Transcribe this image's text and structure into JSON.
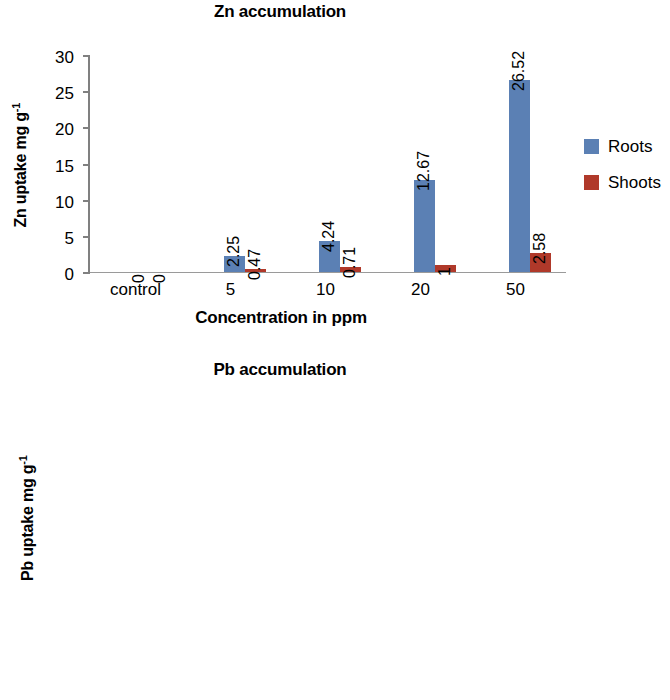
{
  "charts": [
    {
      "id": "zn",
      "title": "Zn accumulation",
      "ylabel_main": "Zn uptake mg g",
      "ylabel_sup": "-1",
      "xlabel": "Concentration in ppm",
      "legend": [
        {
          "label": "Roots",
          "color": "#5b80b4"
        },
        {
          "label": "Shoots",
          "color": "#b0392a"
        }
      ],
      "yticks": [
        "0",
        "5",
        "10",
        "15",
        "20",
        "25",
        "30"
      ],
      "categories": [
        "control",
        "5",
        "10",
        "20",
        "50"
      ],
      "roots_labels": [
        "0",
        "2.25",
        "4.24",
        "12.67",
        "26.52"
      ],
      "shoots_labels": [
        "0",
        "0.47",
        "0.71",
        "1",
        "2.58"
      ]
    },
    {
      "id": "pb",
      "title": "Pb accumulation",
      "ylabel_main": "Pb uptake mg g",
      "ylabel_sup": "-1",
      "xlabel": "Concentration in ppm",
      "legend": [
        {
          "label": "Roots",
          "color": "#5b80b4"
        },
        {
          "label": "Shoots",
          "color": "#b0392a"
        }
      ],
      "yticks": [
        "0",
        "2",
        "4",
        "6",
        "8",
        "10",
        "12",
        "14"
      ],
      "categories": [
        "control",
        "5",
        "10",
        "20",
        "50"
      ],
      "roots_labels": [
        "0",
        "1.26",
        "4.52",
        "7.36",
        "12.26"
      ],
      "shoots_labels": [
        "0",
        "0.24",
        "0.27",
        "0.88",
        "2.48"
      ]
    }
  ],
  "chart_data": [
    {
      "type": "bar",
      "title": "Zn accumulation",
      "xlabel": "Concentration in ppm",
      "ylabel": "Zn uptake mg g-1",
      "categories": [
        "control",
        "5",
        "10",
        "20",
        "50"
      ],
      "series": [
        {
          "name": "Roots",
          "color": "#5b80b4",
          "values": [
            0,
            2.25,
            4.24,
            12.67,
            26.52
          ]
        },
        {
          "name": "Shoots",
          "color": "#b0392a",
          "values": [
            0,
            0.47,
            0.71,
            1,
            2.58
          ]
        }
      ],
      "ylim": [
        0,
        30
      ],
      "ytick_step": 5,
      "yticks": [
        0,
        5,
        10,
        15,
        20,
        25,
        30
      ],
      "grid": false,
      "legend_position": "right",
      "data_labels": true,
      "data_label_rotation": 90
    },
    {
      "type": "bar",
      "title": "Pb accumulation",
      "xlabel": "Concentration in ppm",
      "ylabel": "Pb uptake mg g-1",
      "categories": [
        "control",
        "5",
        "10",
        "20",
        "50"
      ],
      "series": [
        {
          "name": "Roots",
          "color": "#5b80b4",
          "values": [
            0,
            1.26,
            4.52,
            7.36,
            12.26
          ]
        },
        {
          "name": "Shoots",
          "color": "#b0392a",
          "values": [
            0,
            0.24,
            0.27,
            0.88,
            2.48
          ]
        }
      ],
      "ylim": [
        0,
        14
      ],
      "ytick_step": 2,
      "yticks": [
        0,
        2,
        4,
        6,
        8,
        10,
        12,
        14
      ],
      "grid": false,
      "legend_position": "right",
      "data_labels": true,
      "data_label_rotation": 90
    }
  ]
}
